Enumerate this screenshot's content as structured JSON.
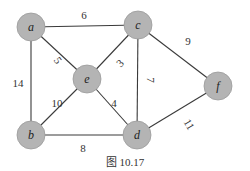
{
  "figure": {
    "caption": "图 10.17",
    "node_fill": "#b4b4b4",
    "edge_color": "#3a3a3a"
  },
  "nodes": [
    {
      "id": "a",
      "label": "a",
      "x": 31,
      "y": 27
    },
    {
      "id": "c",
      "label": "c",
      "x": 138,
      "y": 25
    },
    {
      "id": "e",
      "label": "e",
      "x": 87,
      "y": 79
    },
    {
      "id": "f",
      "label": "f",
      "x": 218,
      "y": 86
    },
    {
      "id": "b",
      "label": "b",
      "x": 31,
      "y": 135
    },
    {
      "id": "d",
      "label": "d",
      "x": 137,
      "y": 135
    }
  ],
  "edges": [
    {
      "from": "a",
      "to": "c",
      "weight": "6",
      "lx": 84,
      "ly": 16,
      "rot": 0
    },
    {
      "from": "a",
      "to": "e",
      "weight": "5",
      "lx": 57,
      "ly": 61,
      "rot": 55
    },
    {
      "from": "a",
      "to": "b",
      "weight": "14",
      "lx": 18,
      "ly": 84,
      "rot": 0
    },
    {
      "from": "e",
      "to": "c",
      "weight": "3",
      "lx": 121,
      "ly": 64,
      "rot": -45
    },
    {
      "from": "e",
      "to": "b",
      "weight": "10",
      "lx": 57,
      "ly": 104,
      "rot": 0
    },
    {
      "from": "e",
      "to": "d",
      "weight": "4",
      "lx": 114,
      "ly": 104,
      "rot": 0
    },
    {
      "from": "c",
      "to": "d",
      "weight": "7",
      "lx": 150,
      "ly": 80,
      "rot": 90
    },
    {
      "from": "c",
      "to": "f",
      "weight": "9",
      "lx": 188,
      "ly": 42,
      "rot": 0
    },
    {
      "from": "b",
      "to": "d",
      "weight": "8",
      "lx": 83,
      "ly": 149,
      "rot": 0
    },
    {
      "from": "d",
      "to": "f",
      "weight": "11",
      "lx": 188,
      "ly": 125,
      "rot": 60
    }
  ]
}
